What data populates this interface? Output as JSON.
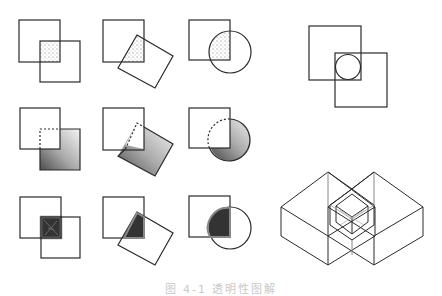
{
  "top_text": {
    "fragments": [
      "· · · · · · · · ·",
      "· · · · · · · · · · ·",
      "· · · · · · · · · · · · · · ·"
    ]
  },
  "figure": {
    "stroke_color": "#2a2a2a",
    "shade_light": "#9a9a9a",
    "shade_dark": "#2e2e2e",
    "rows": [
      {
        "label": "row-1",
        "style": "stippled-overlap",
        "panels": [
          "square-square",
          "square-rotated-square",
          "square-circle"
        ]
      },
      {
        "label": "row-2",
        "style": "shaded-front-shape-dashed-hidden-edge",
        "panels": [
          "square-square",
          "square-rotated-square",
          "square-circle"
        ]
      },
      {
        "label": "row-3",
        "style": "dark-overlap-outlined",
        "panels": [
          "square-square",
          "square-rotated-square",
          "square-circle"
        ]
      }
    ],
    "right_panels": [
      "two-squares-with-inscribed-circle",
      "isometric-interlocking-boxes"
    ]
  },
  "caption": {
    "text": "图 4-1  透明性图解"
  }
}
